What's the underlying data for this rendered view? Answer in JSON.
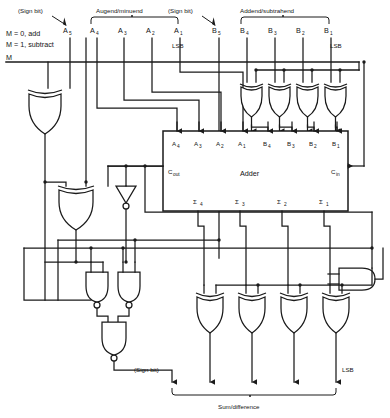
{
  "diagram": {
    "mode_note_line1": "M = 0, add",
    "mode_note_line2": "M = 1, subtract",
    "mode_input_label": "M",
    "sign_bit_label_a": "(Sign bit)",
    "sign_bit_label_b": "(Sign bit)",
    "sign_bit_label_out": "(Sign bit)",
    "augend_group_label": "Augend/minuend",
    "addend_group_label": "Addend/subtrahend",
    "output_group_label": "Sum/difference",
    "lsb_label_a": "LSB",
    "lsb_label_b": "LSB",
    "lsb_label_out": "LSB",
    "adder_label": "Adder",
    "carry_out_label": "C",
    "carry_out_sub": "out",
    "carry_in_label": "C",
    "carry_in_sub": "in"
  },
  "a_inputs": [
    {
      "name": "A",
      "sub": "5",
      "x": 70
    },
    {
      "name": "A",
      "sub": "4",
      "x": 97
    },
    {
      "name": "A",
      "sub": "3",
      "x": 124
    },
    {
      "name": "A",
      "sub": "2",
      "x": 152
    },
    {
      "name": "A",
      "sub": "1",
      "x": 180
    }
  ],
  "b_inputs": [
    {
      "name": "B",
      "sub": "5",
      "x": 219
    },
    {
      "name": "B",
      "sub": "4",
      "x": 247
    },
    {
      "name": "B",
      "sub": "3",
      "x": 275
    },
    {
      "name": "B",
      "sub": "2",
      "x": 303
    },
    {
      "name": "B",
      "sub": "1",
      "x": 331
    }
  ],
  "adder_a_ports": [
    {
      "name": "A",
      "sub": "4",
      "x": 177
    },
    {
      "name": "A",
      "sub": "3",
      "x": 199
    },
    {
      "name": "A",
      "sub": "2",
      "x": 221
    },
    {
      "name": "A",
      "sub": "1",
      "x": 243
    }
  ],
  "adder_b_ports": [
    {
      "name": "B",
      "sub": "4",
      "x": 268
    },
    {
      "name": "B",
      "sub": "3",
      "x": 292
    },
    {
      "name": "B",
      "sub": "2",
      "x": 314
    },
    {
      "name": "B",
      "sub": "1",
      "x": 337
    }
  ],
  "adder_sum_ports": [
    {
      "name": "Σ",
      "sub": "4",
      "x": 198
    },
    {
      "name": "Σ",
      "sub": "3",
      "x": 240
    },
    {
      "name": "Σ",
      "sub": "2",
      "x": 282
    },
    {
      "name": "Σ",
      "sub": "1",
      "x": 324
    }
  ],
  "colors": {
    "line": "#1a1a1a",
    "text": "#141414",
    "background": "#ffffff"
  }
}
